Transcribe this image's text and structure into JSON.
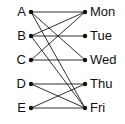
{
  "diagram": {
    "type": "bipartite-graph",
    "title": "",
    "colors": {
      "background": "#ffffff",
      "node": "#111111",
      "edge": "#1a1a1a",
      "label": "#111111"
    },
    "left_nodes": [
      {
        "id": "A",
        "label": "A",
        "x": 31,
        "y": 12
      },
      {
        "id": "B",
        "label": "B",
        "x": 31,
        "y": 36
      },
      {
        "id": "C",
        "label": "C",
        "x": 31,
        "y": 60
      },
      {
        "id": "D",
        "label": "D",
        "x": 31,
        "y": 84
      },
      {
        "id": "E",
        "label": "E",
        "x": 31,
        "y": 108
      }
    ],
    "right_nodes": [
      {
        "id": "Mon",
        "label": "Mon",
        "x": 85,
        "y": 12
      },
      {
        "id": "Tue",
        "label": "Tue",
        "x": 85,
        "y": 36
      },
      {
        "id": "Wed",
        "label": "Wed",
        "x": 85,
        "y": 60
      },
      {
        "id": "Thu",
        "label": "Thu",
        "x": 85,
        "y": 84
      },
      {
        "id": "Fri",
        "label": "Fri",
        "x": 85,
        "y": 108
      }
    ],
    "edges": [
      {
        "from": "A",
        "to": "Mon"
      },
      {
        "from": "A",
        "to": "Wed"
      },
      {
        "from": "A",
        "to": "Fri"
      },
      {
        "from": "B",
        "to": "Mon"
      },
      {
        "from": "B",
        "to": "Tue"
      },
      {
        "from": "B",
        "to": "Fri"
      },
      {
        "from": "C",
        "to": "Mon"
      },
      {
        "from": "C",
        "to": "Wed"
      },
      {
        "from": "D",
        "to": "Thu"
      },
      {
        "from": "D",
        "to": "Fri"
      },
      {
        "from": "E",
        "to": "Thu"
      },
      {
        "from": "E",
        "to": "Fri"
      }
    ],
    "node_radius": 2.2,
    "label_offset": 5
  }
}
